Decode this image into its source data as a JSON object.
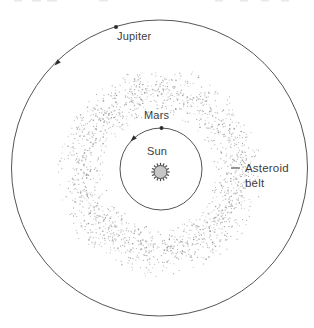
{
  "figure": {
    "labels": {
      "jupiter": "Jupiter",
      "mars": "Mars",
      "sun": "Sun",
      "asteroid_belt": "Asteroid belt"
    }
  },
  "colors": {
    "background": "#ffffff",
    "orbit_stroke": "#555555",
    "marker": "#2f2f2f",
    "text": "#3c3c3c",
    "sun_fill": "#c6c6c6",
    "sun_stroke": "#4a4a4a",
    "leader_line": "#4a4a4a",
    "crop_mark": "#e9e9e9",
    "belt_dots": [
      "#9e9e9e",
      "#ababab",
      "#b6b6b6",
      "#c2c2c2",
      "#cccccc"
    ]
  },
  "diagram": {
    "width": 314,
    "height": 328,
    "center": {
      "x": 159.5,
      "y": 168
    },
    "orbits": [
      {
        "name": "jupiter",
        "radius": 148,
        "marker": {
          "x": 116,
          "y": 27
        },
        "arrow": {
          "x": 57,
          "y": 63
        }
      },
      {
        "name": "mars",
        "radius": 41,
        "center": {
          "x": 161,
          "y": 169
        },
        "marker": {
          "x": 161.5,
          "y": 128
        },
        "arrow": {
          "x": 133,
          "y": 139
        }
      }
    ],
    "sun": {
      "x": 160.5,
      "y": 172,
      "radius": 6.5,
      "spikes": 16
    },
    "belt": {
      "cx": 160,
      "cy": 172,
      "inner": 54,
      "outer": 106,
      "count": 1750,
      "seed": 1337
    },
    "label_leader": {
      "x1": 231,
      "y1": 168,
      "x2": 240,
      "y2": 168
    },
    "top_crop_marks": [
      {
        "x": 14,
        "w": 8
      },
      {
        "x": 32,
        "w": 9
      },
      {
        "x": 47,
        "w": 10
      },
      {
        "x": 99,
        "w": 9
      },
      {
        "x": 215,
        "w": 8
      },
      {
        "x": 240,
        "w": 8
      },
      {
        "x": 261,
        "w": 8
      },
      {
        "x": 281,
        "w": 8
      }
    ]
  }
}
